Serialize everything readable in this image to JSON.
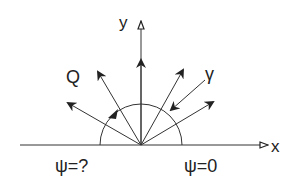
{
  "diagram": {
    "colors": {
      "stroke": "#333333",
      "background": "#ffffff"
    },
    "axes": {
      "x_label": "x",
      "y_label": "y"
    },
    "labels": {
      "q": "Q",
      "gamma": "γ",
      "psi_left": "ψ=?",
      "psi_right": "ψ=0"
    },
    "origin": [
      141,
      145
    ],
    "semicircle_radius": 41,
    "emitted_arrows": [
      {
        "name": "arrow-left-low",
        "end": [
          68,
          103
        ]
      },
      {
        "name": "arrow-left-high",
        "end": [
          98,
          72
        ]
      },
      {
        "name": "arrow-vertical",
        "end": [
          141,
          60
        ]
      },
      {
        "name": "arrow-right-high",
        "end": [
          183,
          70
        ]
      },
      {
        "name": "arrow-right-low",
        "end": [
          213,
          102
        ]
      }
    ],
    "incoming_arrow_gamma": {
      "start": [
        205,
        80
      ],
      "end": [
        170,
        111
      ]
    },
    "arc_arrowhead": [
      113,
      115
    ]
  }
}
